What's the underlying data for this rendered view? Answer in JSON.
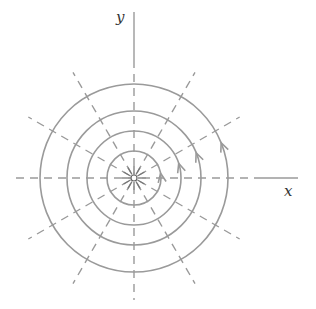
{
  "diagram": {
    "title": "",
    "axes": {
      "x_label": "x",
      "y_label": "y"
    },
    "center": {
      "cx": 134,
      "cy": 178
    },
    "circle_radii": [
      27,
      47,
      67,
      94
    ],
    "radial_line_angles_deg": [
      0,
      30,
      60,
      90,
      120,
      150,
      180,
      210,
      240,
      270,
      300,
      330
    ],
    "arrows": [
      {
        "on_circle": 1,
        "direction": "counterclockwise"
      },
      {
        "on_circle": 2,
        "direction": "counterclockwise"
      },
      {
        "on_circle": 3,
        "direction": "counterclockwise"
      },
      {
        "on_circle": 4,
        "direction": "counterclockwise"
      }
    ],
    "colors": {
      "stroke": "#9a9a9a",
      "label": "#333333"
    }
  }
}
